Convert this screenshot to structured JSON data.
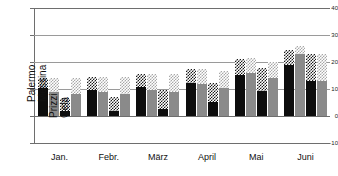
{
  "chart_data": {
    "type": "bar",
    "title": "",
    "subtitle": "",
    "xlabel": "",
    "ylabel": "",
    "ylim": [
      -10,
      40
    ],
    "yticks": [
      40,
      30,
      20,
      10,
      0,
      -10
    ],
    "ytick_labels": [
      "40",
      "30",
      "20",
      "10",
      "0",
      "-10"
    ],
    "grid": true,
    "grid_axis": "y",
    "legend_position": "in-plot-rotated-labels",
    "categories": [
      "Jan.",
      "Febr.",
      "März",
      "April",
      "Mai",
      "Juni"
    ],
    "series": [
      {
        "name": "Palermo",
        "fill": "black",
        "cap_fill": "checker-dark",
        "values": [
          10.3,
          9.7,
          10.6,
          12.3,
          15.3,
          19.0
        ],
        "cap_values": [
          14.2,
          14.5,
          15.5,
          17.5,
          21.0,
          24.5
        ]
      },
      {
        "name": "Messina",
        "fill": "gray",
        "cap_fill": "checker-light",
        "values": [
          8.8,
          9.0,
          9.7,
          11.8,
          15.8,
          22.8
        ],
        "cap_values": [
          14.2,
          14.3,
          15.4,
          17.4,
          21.5,
          26.0
        ]
      },
      {
        "name": "Prizzi",
        "fill": "black",
        "cap_fill": "checker-dark",
        "values": [
          1.8,
          2.0,
          2.6,
          5.1,
          9.4,
          13.0
        ],
        "cap_values": [
          6.6,
          7.0,
          9.5,
          12.2,
          17.8,
          22.8
        ]
      },
      {
        "name": "Gela",
        "fill": "gray",
        "cap_fill": "checker-light",
        "values": [
          8.3,
          8.3,
          8.9,
          10.5,
          14.1,
          13.0
        ],
        "cap_values": [
          14.2,
          14.4,
          15.4,
          16.8,
          19.9,
          22.8
        ]
      }
    ]
  },
  "axis": {
    "y_tick_40": "40",
    "y_tick_30": "30",
    "y_tick_20": "20",
    "y_tick_10": "10",
    "y_tick_0": "0",
    "y_tick_neg10": "-10"
  },
  "colors": {
    "series_black": "#0d0d0d",
    "series_gray": "#8a8a8a",
    "series_white": "#ffffff",
    "checker_dark": "#1b1b1b",
    "checker_light": "#a8a8a8",
    "gridline": "#9a9a9a",
    "axis": "#6e6e6e",
    "background": "#ffffff",
    "text": "#111111"
  }
}
